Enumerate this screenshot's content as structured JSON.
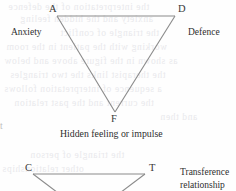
{
  "page": {
    "kind": "scanned-book-figure",
    "background_color": "#fefefe",
    "line_color": "#8a8a8a",
    "text_color": "#2b2b2b",
    "ghost_text_color": "#e9e9ec",
    "margin_fragment": "t"
  },
  "diagram_top": {
    "name": "triangle-of-conflict",
    "vertices": [
      {
        "key": "A",
        "label": "A",
        "meaning": "Anxiety",
        "x": 57,
        "y": 16
      },
      {
        "key": "D",
        "label": "D",
        "meaning": "Defence",
        "x": 175,
        "y": 16
      },
      {
        "key": "F",
        "label": "F",
        "meaning": "Hidden feeling or impulse",
        "x": 115,
        "y": 112
      }
    ],
    "labels": {
      "vertex_a": "A",
      "vertex_d": "D",
      "vertex_f": "F",
      "side_left": "Anxiety",
      "side_right": "Defence",
      "caption_bottom": "Hidden feeling or impulse"
    }
  },
  "diagram_bottom": {
    "name": "triangle-of-person",
    "clipped": true,
    "vertices": [
      {
        "key": "C",
        "label": "C",
        "x": 33,
        "y": 174
      },
      {
        "key": "T",
        "label": "T",
        "x": 145,
        "y": 174
      }
    ],
    "labels": {
      "vertex_c": "C",
      "vertex_t": "T",
      "side_right_line1": "Transference",
      "side_right_line2": "relationship"
    }
  }
}
